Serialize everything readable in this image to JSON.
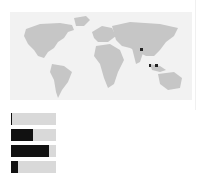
{
  "map": {
    "land_color": "#c6c6c6",
    "background_color": "#f2f2f2",
    "highlight_color": "#222222",
    "highlighted_regions": [
      "Bangladesh",
      "Southeast Asia (island region A)",
      "Southeast Asia (island region B)"
    ]
  },
  "bars": [
    {
      "fill_percent": 3
    },
    {
      "fill_percent": 49
    },
    {
      "fill_percent": 84
    },
    {
      "fill_percent": 16
    }
  ]
}
